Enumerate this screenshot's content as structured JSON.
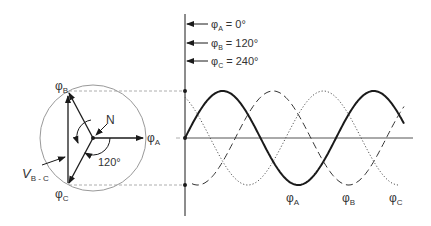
{
  "phasor": {
    "neutral_label": "N",
    "angle_label": "120°",
    "line_voltage_label": "V",
    "line_voltage_sub": "B - C",
    "phase_a": {
      "sym": "φ",
      "sub": "A"
    },
    "phase_b": {
      "sym": "φ",
      "sub": "B"
    },
    "phase_c": {
      "sym": "φ",
      "sub": "C"
    }
  },
  "legend": [
    {
      "sym": "φ",
      "sub": "A",
      "value": " = 0°"
    },
    {
      "sym": "φ",
      "sub": "B",
      "value": " = 120°"
    },
    {
      "sym": "φ",
      "sub": "C",
      "value": " = 240°"
    }
  ],
  "waveforms": {
    "labels": [
      {
        "sym": "φ",
        "sub": "A"
      },
      {
        "sym": "φ",
        "sub": "B"
      },
      {
        "sym": "φ",
        "sub": "C"
      }
    ],
    "styles": {
      "A": "solid",
      "B": "dashed",
      "C": "dotted"
    }
  },
  "colors": {
    "line": "#1a1a1a",
    "circle": "#888888",
    "guide": "#999999",
    "text": "#333333"
  }
}
